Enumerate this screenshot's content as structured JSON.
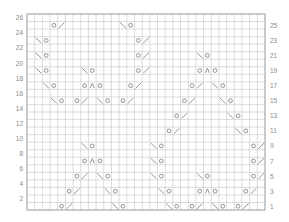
{
  "chart": {
    "columns": 31,
    "rows": 26,
    "grid": {
      "left": 27,
      "top": 14,
      "right": 265,
      "bottom": 210
    },
    "colors": {
      "grid": "#c4c4c4",
      "border": "#9a9a9a",
      "symbol": "#7a7a7a",
      "label": "#8a8a8a"
    },
    "left_labels": [
      "26",
      "24",
      "22",
      "20",
      "18",
      "16",
      "14",
      "12",
      "10",
      "8",
      "6",
      "4",
      "2"
    ],
    "right_labels": [
      "25",
      "23",
      "21",
      "19",
      "17",
      "15",
      "13",
      "11",
      "9",
      "7",
      "5",
      "3",
      "1"
    ],
    "legend": {
      "O": "yarn-over",
      "/": "knit-2-together",
      "\\": "slip-slip-knit",
      "^": "central-double-decrease"
    },
    "stitches": [
      {
        "row": 1,
        "col": 4,
        "s": "O"
      },
      {
        "row": 1,
        "col": 5,
        "s": "/"
      },
      {
        "row": 1,
        "col": 11,
        "s": "\\"
      },
      {
        "row": 1,
        "col": 12,
        "s": "O"
      },
      {
        "row": 1,
        "col": 18,
        "s": "\\"
      },
      {
        "row": 1,
        "col": 19,
        "s": "O"
      },
      {
        "row": 1,
        "col": 21,
        "s": "O"
      },
      {
        "row": 1,
        "col": 22,
        "s": "/"
      },
      {
        "row": 1,
        "col": 24,
        "s": "\\"
      },
      {
        "row": 1,
        "col": 25,
        "s": "O"
      },
      {
        "row": 1,
        "col": 27,
        "s": "O"
      },
      {
        "row": 1,
        "col": 28,
        "s": "/"
      },
      {
        "row": 3,
        "col": 5,
        "s": "O"
      },
      {
        "row": 3,
        "col": 6,
        "s": "/"
      },
      {
        "row": 3,
        "col": 10,
        "s": "\\"
      },
      {
        "row": 3,
        "col": 11,
        "s": "O"
      },
      {
        "row": 3,
        "col": 17,
        "s": "\\"
      },
      {
        "row": 3,
        "col": 18,
        "s": "O"
      },
      {
        "row": 3,
        "col": 22,
        "s": "O"
      },
      {
        "row": 3,
        "col": 23,
        "s": "^"
      },
      {
        "row": 3,
        "col": 24,
        "s": "O"
      },
      {
        "row": 3,
        "col": 28,
        "s": "O"
      },
      {
        "row": 3,
        "col": 29,
        "s": "/"
      },
      {
        "row": 5,
        "col": 6,
        "s": "O"
      },
      {
        "row": 5,
        "col": 7,
        "s": "/"
      },
      {
        "row": 5,
        "col": 9,
        "s": "\\"
      },
      {
        "row": 5,
        "col": 10,
        "s": "O"
      },
      {
        "row": 5,
        "col": 16,
        "s": "\\"
      },
      {
        "row": 5,
        "col": 17,
        "s": "O"
      },
      {
        "row": 5,
        "col": 22,
        "s": "\\"
      },
      {
        "row": 5,
        "col": 23,
        "s": "O"
      },
      {
        "row": 5,
        "col": 29,
        "s": "O"
      },
      {
        "row": 5,
        "col": 30,
        "s": "/"
      },
      {
        "row": 7,
        "col": 7,
        "s": "O"
      },
      {
        "row": 7,
        "col": 8,
        "s": "^"
      },
      {
        "row": 7,
        "col": 9,
        "s": "O"
      },
      {
        "row": 7,
        "col": 16,
        "s": "\\"
      },
      {
        "row": 7,
        "col": 17,
        "s": "O"
      },
      {
        "row": 7,
        "col": 29,
        "s": "O"
      },
      {
        "row": 7,
        "col": 30,
        "s": "/"
      },
      {
        "row": 9,
        "col": 7,
        "s": "\\"
      },
      {
        "row": 9,
        "col": 8,
        "s": "O"
      },
      {
        "row": 9,
        "col": 16,
        "s": "\\"
      },
      {
        "row": 9,
        "col": 17,
        "s": "O"
      },
      {
        "row": 9,
        "col": 29,
        "s": "O"
      },
      {
        "row": 9,
        "col": 30,
        "s": "/"
      },
      {
        "row": 11,
        "col": 18,
        "s": "O"
      },
      {
        "row": 11,
        "col": 19,
        "s": "/"
      },
      {
        "row": 11,
        "col": 27,
        "s": "\\"
      },
      {
        "row": 11,
        "col": 28,
        "s": "O"
      },
      {
        "row": 13,
        "col": 19,
        "s": "O"
      },
      {
        "row": 13,
        "col": 20,
        "s": "/"
      },
      {
        "row": 13,
        "col": 26,
        "s": "\\"
      },
      {
        "row": 13,
        "col": 27,
        "s": "O"
      },
      {
        "row": 15,
        "col": 3,
        "s": "\\"
      },
      {
        "row": 15,
        "col": 4,
        "s": "O"
      },
      {
        "row": 15,
        "col": 6,
        "s": "O"
      },
      {
        "row": 15,
        "col": 7,
        "s": "/"
      },
      {
        "row": 15,
        "col": 9,
        "s": "\\"
      },
      {
        "row": 15,
        "col": 10,
        "s": "O"
      },
      {
        "row": 15,
        "col": 12,
        "s": "O"
      },
      {
        "row": 15,
        "col": 13,
        "s": "/"
      },
      {
        "row": 15,
        "col": 20,
        "s": "O"
      },
      {
        "row": 15,
        "col": 21,
        "s": "/"
      },
      {
        "row": 15,
        "col": 25,
        "s": "\\"
      },
      {
        "row": 15,
        "col": 26,
        "s": "O"
      },
      {
        "row": 17,
        "col": 2,
        "s": "\\"
      },
      {
        "row": 17,
        "col": 3,
        "s": "O"
      },
      {
        "row": 17,
        "col": 7,
        "s": "O"
      },
      {
        "row": 17,
        "col": 8,
        "s": "^"
      },
      {
        "row": 17,
        "col": 9,
        "s": "O"
      },
      {
        "row": 17,
        "col": 13,
        "s": "O"
      },
      {
        "row": 17,
        "col": 14,
        "s": "/"
      },
      {
        "row": 17,
        "col": 21,
        "s": "O"
      },
      {
        "row": 17,
        "col": 22,
        "s": "/"
      },
      {
        "row": 17,
        "col": 24,
        "s": "\\"
      },
      {
        "row": 17,
        "col": 25,
        "s": "O"
      },
      {
        "row": 19,
        "col": 1,
        "s": "\\"
      },
      {
        "row": 19,
        "col": 2,
        "s": "O"
      },
      {
        "row": 19,
        "col": 7,
        "s": "\\"
      },
      {
        "row": 19,
        "col": 8,
        "s": "O"
      },
      {
        "row": 19,
        "col": 14,
        "s": "O"
      },
      {
        "row": 19,
        "col": 15,
        "s": "/"
      },
      {
        "row": 19,
        "col": 22,
        "s": "O"
      },
      {
        "row": 19,
        "col": 23,
        "s": "^"
      },
      {
        "row": 19,
        "col": 24,
        "s": "O"
      },
      {
        "row": 21,
        "col": 1,
        "s": "\\"
      },
      {
        "row": 21,
        "col": 2,
        "s": "O"
      },
      {
        "row": 21,
        "col": 14,
        "s": "O"
      },
      {
        "row": 21,
        "col": 15,
        "s": "/"
      },
      {
        "row": 21,
        "col": 22,
        "s": "\\"
      },
      {
        "row": 21,
        "col": 23,
        "s": "O"
      },
      {
        "row": 23,
        "col": 1,
        "s": "\\"
      },
      {
        "row": 23,
        "col": 2,
        "s": "O"
      },
      {
        "row": 23,
        "col": 14,
        "s": "O"
      },
      {
        "row": 23,
        "col": 15,
        "s": "/"
      },
      {
        "row": 25,
        "col": 3,
        "s": "O"
      },
      {
        "row": 25,
        "col": 4,
        "s": "/"
      },
      {
        "row": 25,
        "col": 12,
        "s": "\\"
      },
      {
        "row": 25,
        "col": 13,
        "s": "O"
      }
    ]
  }
}
